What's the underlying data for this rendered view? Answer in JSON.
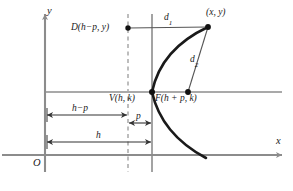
{
  "figure": {
    "colors": {
      "axis": "#8c8c8c",
      "curve": "#1a1a1a",
      "thin_line": "#555555",
      "directrix": "#a0a0a0",
      "text": "#1a1a1a",
      "background": "#ffffff"
    },
    "axes": {
      "x_label": "x",
      "y_label": "y",
      "origin_label": "O"
    },
    "points": [
      {
        "name": "directrix-point",
        "label": "D(h−p, y)",
        "x": 128,
        "y": 28
      },
      {
        "name": "curve-point",
        "label": "(x, y)",
        "x": 208,
        "y": 27
      },
      {
        "name": "vertex",
        "label": "V(h, k)",
        "x": 152,
        "y": 92
      },
      {
        "name": "focus",
        "label": "F(h + p, k)",
        "x": 188,
        "y": 92
      }
    ],
    "distances": [
      {
        "name": "d1",
        "base": "d",
        "sub": "1"
      },
      {
        "name": "d2",
        "base": "d",
        "sub": "2"
      }
    ],
    "measurements": [
      {
        "name": "h-minus-p",
        "label": "h−p"
      },
      {
        "name": "p",
        "label": "p"
      },
      {
        "name": "h",
        "label": "h"
      }
    ]
  }
}
